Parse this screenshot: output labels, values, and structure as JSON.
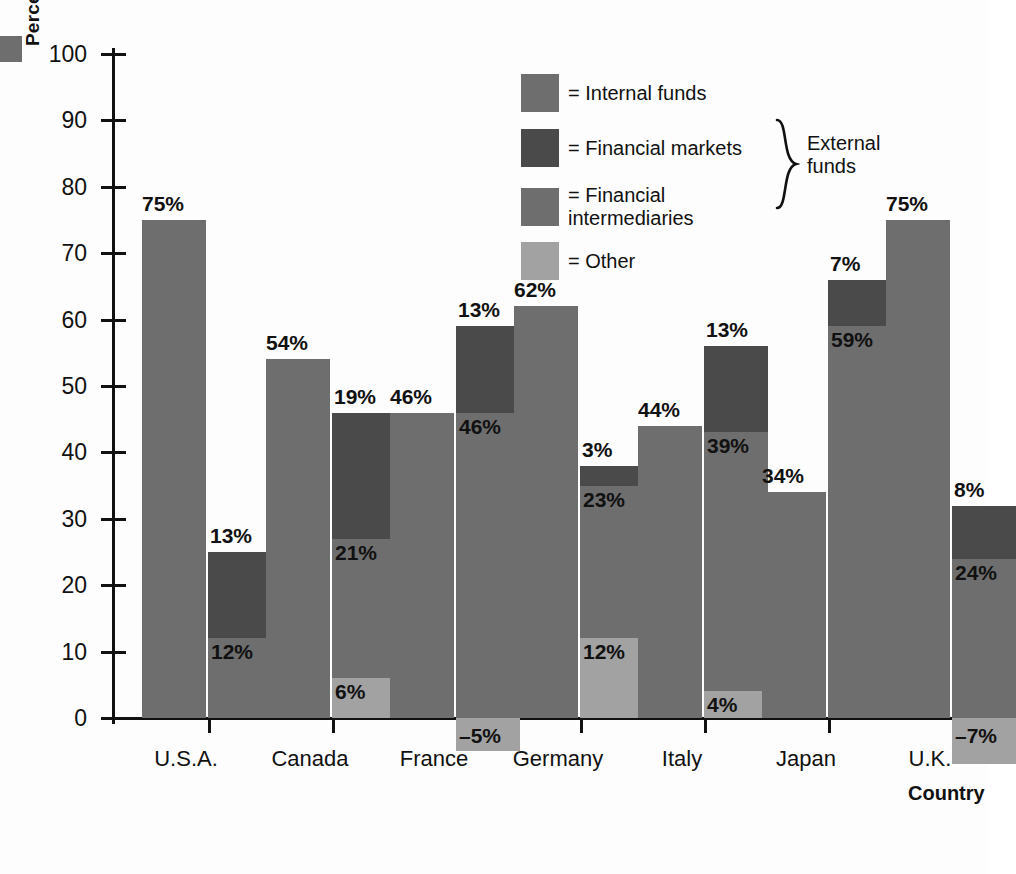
{
  "chart_data": {
    "type": "bar",
    "subtype": "grouped-stacked",
    "title": "",
    "xlabel": "Country",
    "ylabel": "Percentage of finance",
    "ylim": [
      0,
      100
    ],
    "ytick_step": 10,
    "yticks": [
      100,
      90,
      80,
      70,
      60,
      50,
      40,
      30,
      20,
      10,
      0
    ],
    "grid": false,
    "legend_position": "inside-top-center",
    "categories": [
      "U.S.A.",
      "Canada",
      "France",
      "Germany",
      "Italy",
      "Japan",
      "U.K."
    ],
    "series": [
      {
        "name": "Internal funds",
        "color": "#6e6e6e",
        "values": [
          75,
          54,
          46,
          62,
          44,
          34,
          75
        ],
        "labels": [
          "75%",
          "54%",
          "46%",
          "62%",
          "44%",
          "34%",
          "75%"
        ]
      },
      {
        "name": "Other",
        "color": "#a2a2a2",
        "values": [
          null,
          6,
          -5,
          12,
          4,
          null,
          -7
        ],
        "labels": [
          "",
          "6%",
          "–5%",
          "12%",
          "4%",
          "",
          "–7%"
        ]
      },
      {
        "name": "Financial intermediaries",
        "color": "#6e6e6e",
        "values": [
          12,
          21,
          46,
          23,
          39,
          59,
          24
        ],
        "labels": [
          "12%",
          "21%",
          "46%",
          "23%",
          "39%",
          "59%",
          "24%"
        ]
      },
      {
        "name": "Financial markets",
        "color": "#4a4a4a",
        "values": [
          13,
          19,
          13,
          3,
          13,
          7,
          8
        ],
        "labels": [
          "13%",
          "19%",
          "13%",
          "3%",
          "13%",
          "7%",
          "8%"
        ]
      }
    ],
    "external_totals": [
      25,
      46,
      59,
      38,
      56,
      66,
      32
    ]
  },
  "axes": {
    "y_title": "Percentage of finance",
    "x_title": "Country",
    "y_tick_labels": [
      "100",
      "90",
      "80",
      "70",
      "60",
      "50",
      "40",
      "30",
      "20",
      "10",
      "0"
    ],
    "x_tick_labels": [
      "U.S.A.",
      "Canada",
      "France",
      "Germany",
      "Italy",
      "Japan",
      "U.K."
    ]
  },
  "legend": {
    "items": [
      {
        "label": "= Internal funds",
        "swatch": "#6e6e6e",
        "swatch_name": "legend-swatch-internal-funds"
      },
      {
        "label": "= Financial markets",
        "swatch": "#4a4a4a",
        "swatch_name": "legend-swatch-financial-markets"
      },
      {
        "label": "= Financial\nintermediaries",
        "swatch": "#6e6e6e",
        "swatch_name": "legend-swatch-financial-intermediaries"
      },
      {
        "label": "= Other",
        "swatch": "#a2a2a2",
        "swatch_name": "legend-swatch-other"
      }
    ],
    "bracket_label": "External\nfunds"
  },
  "colors": {
    "internal_funds": "#6e6e6e",
    "financial_markets": "#4a4a4a",
    "financial_intermediaries": "#6e6e6e",
    "other": "#a2a2a2",
    "axis": "#111111",
    "background": "#fdfdfd"
  }
}
